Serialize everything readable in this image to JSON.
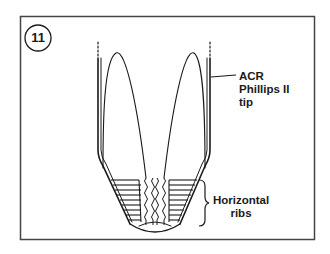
{
  "figure": {
    "number": "11",
    "labels": {
      "tip": [
        "ACR",
        "Phillips II",
        "tip"
      ],
      "ribs": [
        "Horizontal",
        "ribs"
      ]
    },
    "colors": {
      "line": "#1a1a1a",
      "frame": "#444444",
      "background": "#ffffff"
    }
  }
}
